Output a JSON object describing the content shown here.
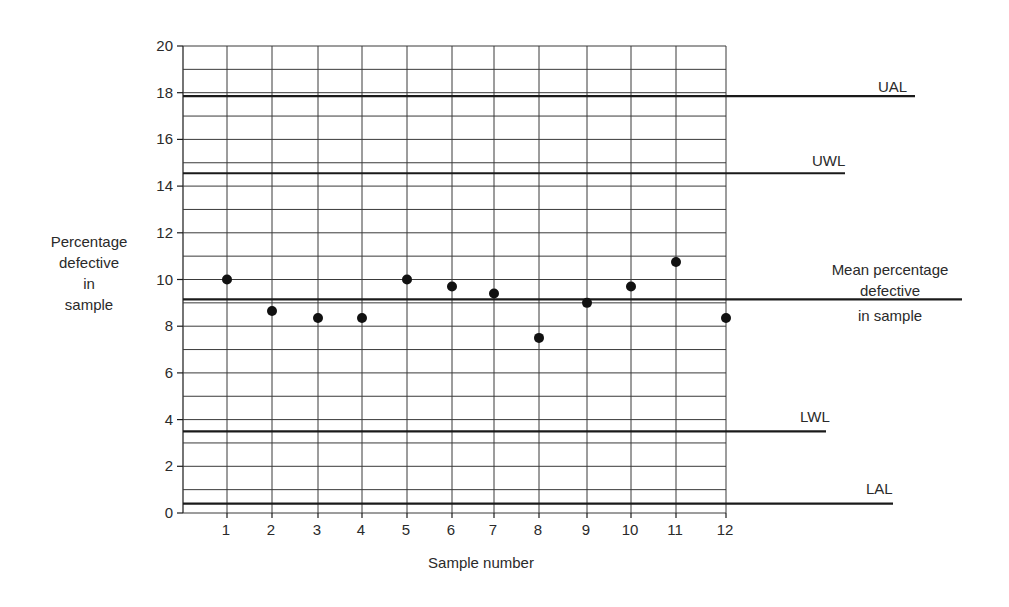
{
  "chart_data": {
    "type": "scatter",
    "title": "",
    "xlabel": "Sample number",
    "ylabel_lines": [
      "Percentage",
      "defective",
      "in",
      "sample"
    ],
    "ylabel": "Percentage defective in sample",
    "ylim": [
      0,
      20
    ],
    "xlim": [
      0,
      12
    ],
    "y_ticks": [
      0,
      2,
      4,
      6,
      8,
      10,
      12,
      14,
      16,
      18,
      20
    ],
    "y_minor_step": 1,
    "x_ticks": [
      1,
      2,
      3,
      4,
      5,
      6,
      7,
      8,
      9,
      10,
      11,
      12
    ],
    "grid": true,
    "x": [
      1,
      2,
      3,
      4,
      5,
      6,
      7,
      8,
      9,
      10,
      11,
      12
    ],
    "values": [
      10.0,
      8.65,
      8.35,
      8.35,
      10.0,
      9.7,
      9.4,
      7.5,
      9.0,
      9.7,
      10.75,
      8.35
    ],
    "reference_lines": [
      {
        "name": "UAL",
        "label": "UAL",
        "value": 17.85,
        "extend_to_px": 915,
        "label_x": 878,
        "label_y": 92
      },
      {
        "name": "UWL",
        "label": "UWL",
        "value": 14.55,
        "extend_to_px": 845,
        "label_x": 812,
        "label_y": 166
      },
      {
        "name": "Mean",
        "label_lines": [
          "Mean percentage",
          "defective",
          "in  sample"
        ],
        "value": 9.15,
        "extend_to_px": 962
      },
      {
        "name": "LWL",
        "label": "LWL",
        "value": 3.5,
        "extend_to_px": 826,
        "label_x": 800,
        "label_y": 422
      },
      {
        "name": "LAL",
        "label": "LAL",
        "value": 0.4,
        "extend_to_px": 893,
        "label_x": 866,
        "label_y": 494
      }
    ]
  },
  "labels": {
    "ylabel_lines": [
      "Percentage",
      "defective",
      "in",
      "sample"
    ],
    "mean_lines": [
      "Mean percentage",
      "defective",
      "in  sample"
    ],
    "xlabel": "Sample number"
  },
  "colors": {
    "ink": "#1a1a1a",
    "grid": "#3a3a3a",
    "background": "#ffffff"
  }
}
